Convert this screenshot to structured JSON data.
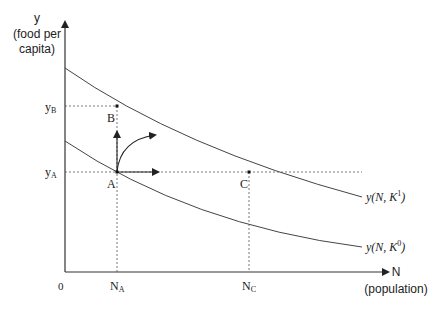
{
  "diagram": {
    "type": "economic-graph",
    "y_axis": {
      "label": "y",
      "sublabel_line1": "(food per",
      "sublabel_line2": "capita)"
    },
    "x_axis": {
      "label": "N",
      "sublabel": "(population)"
    },
    "origin_label": "0",
    "y_ticks": [
      {
        "main": "y",
        "sub": "B"
      },
      {
        "main": "y",
        "sub": "A"
      }
    ],
    "x_ticks": [
      {
        "main": "N",
        "sub": "A"
      },
      {
        "main": "N",
        "sub": "C"
      }
    ],
    "points": [
      {
        "label": "A"
      },
      {
        "label": "B"
      },
      {
        "label": "C"
      }
    ],
    "curves": [
      {
        "name": "upper",
        "label": "y(N, K",
        "superscript": "1",
        "close": ")"
      },
      {
        "name": "lower",
        "label": "y(N, K",
        "superscript": "0",
        "close": ")"
      }
    ],
    "colors": {
      "line": "#333333",
      "text": "#222222"
    }
  }
}
